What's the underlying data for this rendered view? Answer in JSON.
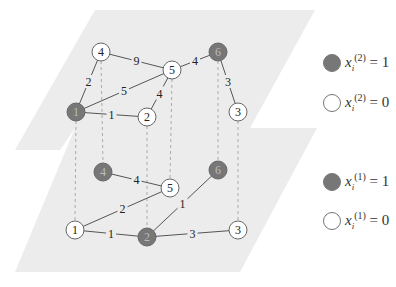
{
  "colors": {
    "plane_fill": "#ececec",
    "node_filled": "#777777",
    "node_empty": "#ffffff",
    "node_stroke": "#666666",
    "edge": "#555555",
    "dashed": "#aaaaaa",
    "text": "#222222"
  },
  "layers": [
    {
      "name": "layer-2",
      "nodes": [
        {
          "id": "1",
          "label": "1",
          "x": 76,
          "y": 112,
          "filled": true
        },
        {
          "id": "2",
          "label": "2",
          "x": 147,
          "y": 117,
          "filled": false
        },
        {
          "id": "3",
          "label": "3",
          "x": 238,
          "y": 112,
          "filled": false
        },
        {
          "id": "4",
          "label": "4",
          "x": 101,
          "y": 52,
          "filled": false
        },
        {
          "id": "5",
          "label": "5",
          "x": 172,
          "y": 70,
          "filled": false
        },
        {
          "id": "6",
          "label": "6",
          "x": 218,
          "y": 52,
          "filled": true
        }
      ],
      "edges": [
        {
          "from": "4",
          "to": "5",
          "weight": "9"
        },
        {
          "from": "4",
          "to": "1",
          "weight": "2"
        },
        {
          "from": "1",
          "to": "5",
          "weight": "5"
        },
        {
          "from": "1",
          "to": "2",
          "weight": "1"
        },
        {
          "from": "2",
          "to": "5",
          "weight": "4"
        },
        {
          "from": "5",
          "to": "6",
          "weight": "4"
        },
        {
          "from": "6",
          "to": "3",
          "weight": "3"
        }
      ]
    },
    {
      "name": "layer-1",
      "nodes": [
        {
          "id": "1",
          "label": "1",
          "x": 75,
          "y": 230,
          "filled": false
        },
        {
          "id": "2",
          "label": "2",
          "x": 147,
          "y": 237,
          "filled": true
        },
        {
          "id": "3",
          "label": "3",
          "x": 238,
          "y": 230,
          "filled": false
        },
        {
          "id": "4",
          "label": "4",
          "x": 103,
          "y": 172,
          "filled": true
        },
        {
          "id": "5",
          "label": "5",
          "x": 170,
          "y": 188,
          "filled": false
        },
        {
          "id": "6",
          "label": "6",
          "x": 218,
          "y": 170,
          "filled": true
        }
      ],
      "edges": [
        {
          "from": "4",
          "to": "5",
          "weight": "4"
        },
        {
          "from": "1",
          "to": "5",
          "weight": "2"
        },
        {
          "from": "1",
          "to": "2",
          "weight": "1"
        },
        {
          "from": "2",
          "to": "6",
          "weight": "1"
        },
        {
          "from": "2",
          "to": "3",
          "weight": "3"
        }
      ]
    }
  ],
  "legend": [
    {
      "filled": true,
      "var": "x",
      "sub": "i",
      "sup": "(2)",
      "value": "= 1"
    },
    {
      "filled": false,
      "var": "x",
      "sub": "i",
      "sup": "(2)",
      "value": "= 0"
    },
    {
      "filled": true,
      "var": "x",
      "sub": "i",
      "sup": "(1)",
      "value": "= 1"
    },
    {
      "filled": false,
      "var": "x",
      "sub": "i",
      "sup": "(1)",
      "value": "= 0"
    }
  ]
}
